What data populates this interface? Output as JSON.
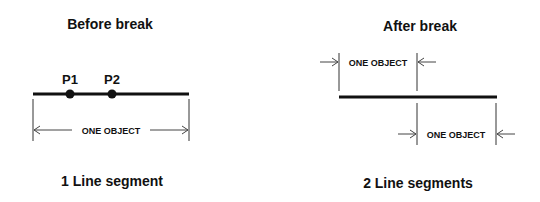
{
  "before": {
    "title": "Before break",
    "point_labels": [
      "P1",
      "P2"
    ],
    "dimension_label": "ONE OBJECT",
    "caption": "1 Line segment"
  },
  "after": {
    "title": "After break",
    "dimension_labels": [
      "ONE OBJECT",
      "ONE OBJECT"
    ],
    "caption": "2 Line segments"
  },
  "colors": {
    "line": "#111111",
    "background": "#ffffff"
  }
}
